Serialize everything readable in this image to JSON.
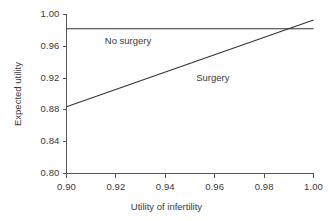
{
  "chart_data": {
    "type": "line",
    "title": "",
    "xlabel": "Utility of infertility",
    "ylabel": "Expected utility",
    "xlim": [
      0.9,
      1.0
    ],
    "ylim": [
      0.8,
      1.0
    ],
    "xticks": [
      "0.90",
      "0.92",
      "0.94",
      "0.96",
      "0.98",
      "1.00"
    ],
    "xtick_values": [
      0.9,
      0.92,
      0.94,
      0.96,
      0.98,
      1.0
    ],
    "yticks": [
      "0.80",
      "0.84",
      "0.88",
      "0.92",
      "0.96",
      "1.00"
    ],
    "ytick_values": [
      0.8,
      0.84,
      0.88,
      0.92,
      0.96,
      1.0
    ],
    "grid": false,
    "legend_position": "inline-annotations",
    "line_color": "#333333",
    "axis_color": "#555555",
    "series": [
      {
        "name": "No surgery",
        "x": [
          0.9,
          1.0
        ],
        "values": [
          0.982,
          0.982
        ],
        "annotation": "No surgery",
        "annotation_x": 0.9155,
        "annotation_y": 0.9655
      },
      {
        "name": "Surgery",
        "x": [
          0.9,
          1.0
        ],
        "values": [
          0.884,
          0.993
        ],
        "annotation": "Surgery",
        "annotation_x": 0.9525,
        "annotation_y": 0.9185
      }
    ],
    "intersection": {
      "x": 0.9965,
      "y": 0.982
    }
  }
}
